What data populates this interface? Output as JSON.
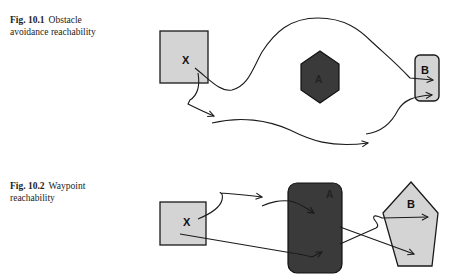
{
  "figures": [
    {
      "number": "Fig. 10.1",
      "caption_line1": "Obstacle",
      "caption_line2": "avoidance reachability",
      "start_label": "X",
      "obstacle_label": "A",
      "goal_label": "B"
    },
    {
      "number": "Fig. 10.2",
      "caption_line1": "Waypoint",
      "caption_line2": "reachability",
      "start_label": "X",
      "obstacle_label": "A",
      "goal_label": "B"
    }
  ],
  "colors": {
    "light_fill": "#d4d4d4",
    "dark_fill": "#3a3a3a",
    "stroke": "#1a1a1a"
  }
}
